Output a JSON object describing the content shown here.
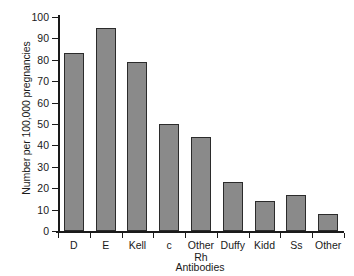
{
  "chart_data": {
    "type": "bar",
    "title": "",
    "xlabel": "Antibodies",
    "ylabel": "Number per 100,000 pregnancies",
    "categories": [
      "D",
      "E",
      "Kell",
      "c",
      "Other Rh",
      "Duffy",
      "Kidd",
      "Ss",
      "Other"
    ],
    "category_lines": [
      [
        "D"
      ],
      [
        "E"
      ],
      [
        "Kell"
      ],
      [
        "c"
      ],
      [
        "Other",
        "Rh"
      ],
      [
        "Duffy"
      ],
      [
        "Kidd"
      ],
      [
        "Ss"
      ],
      [
        "Other"
      ]
    ],
    "values": [
      83,
      95,
      79,
      50,
      44,
      23,
      14,
      17,
      8
    ],
    "ylim": [
      0,
      100
    ],
    "yticks": [
      0,
      10,
      20,
      30,
      40,
      50,
      60,
      70,
      80,
      90,
      100
    ],
    "ytick_labels": [
      "0",
      "10",
      "20",
      "30",
      "40",
      "50",
      "60",
      "70",
      "80",
      "90",
      "100"
    ],
    "grid": false,
    "legend": null,
    "bar_color": "#8a8a8a",
    "bar_edge_color": "#2b2b2b",
    "axis_color": "#1a1a1a",
    "background": "#ffffff"
  }
}
